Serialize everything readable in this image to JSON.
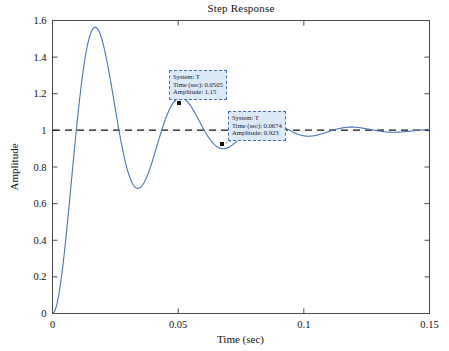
{
  "figure": {
    "title": "Step Response",
    "background": "#ffffff",
    "axes_color": "#4a4a4a",
    "curve_color": "#4a74b4",
    "reference_line_color": "#111111",
    "datatip_fill": "#dce9f6",
    "datatip_border": "#4a6fa5"
  },
  "axes": {
    "xlabel": "Time (sec)",
    "ylabel": "Amplitude",
    "xticks": [
      "0",
      "0.05",
      "0.1",
      "0.15"
    ],
    "yticks": [
      "0",
      "0.2",
      "0.4",
      "0.6",
      "0.8",
      "1",
      "1.2",
      "1.4",
      "1.6"
    ]
  },
  "datatips": [
    {
      "id": "datatip-peak",
      "system": "System: T",
      "time": "Time (sec): 0.0505",
      "amplitude": "Amplitude: 1.15",
      "point": {
        "t": 0.0505,
        "y": 1.15
      }
    },
    {
      "id": "datatip-trough",
      "system": "System: T",
      "time": "Time (sec): 0.0674",
      "amplitude": "Amplitude: 0.923",
      "point": {
        "t": 0.0674,
        "y": 0.923
      }
    }
  ],
  "chart_data": {
    "type": "line",
    "title": "Step Response",
    "xlabel": "Time (sec)",
    "ylabel": "Amplitude",
    "xlim": [
      0,
      0.15
    ],
    "ylim": [
      0,
      1.6
    ],
    "xticks": [
      0,
      0.05,
      0.1,
      0.15
    ],
    "yticks": [
      0,
      0.2,
      0.4,
      0.6,
      0.8,
      1,
      1.2,
      1.4,
      1.6
    ],
    "grid": false,
    "legend": null,
    "reference_lines": [
      {
        "orientation": "horizontal",
        "value": 1,
        "style": "dashed",
        "color": "#111111"
      }
    ],
    "series": [
      {
        "name": "T",
        "color": "#4a74b4",
        "model": "underdamped second order step response",
        "damping_ratio": 0.18,
        "damped_natural_frequency_rad_s": 185,
        "natural_frequency_rad_s": 188,
        "settling_value": 1.0,
        "key_points": [
          {
            "t": 0.0,
            "y": 0.0
          },
          {
            "t": 0.0165,
            "y": 1.53
          },
          {
            "t": 0.03,
            "y": 0.72
          },
          {
            "t": 0.0505,
            "y": 1.15
          },
          {
            "t": 0.0674,
            "y": 0.923
          },
          {
            "t": 0.0845,
            "y": 1.05
          },
          {
            "t": 0.1015,
            "y": 0.975
          },
          {
            "t": 0.1185,
            "y": 1.02
          },
          {
            "t": 0.1355,
            "y": 0.99
          },
          {
            "t": 0.15,
            "y": 1.0
          }
        ]
      }
    ],
    "annotations": [
      {
        "label": "System: T / Time (sec): 0.0505 / Amplitude: 1.15",
        "t": 0.0505,
        "y": 1.15
      },
      {
        "label": "System: T / Time (sec): 0.0674 / Amplitude: 0.923",
        "t": 0.0674,
        "y": 0.923
      }
    ]
  }
}
